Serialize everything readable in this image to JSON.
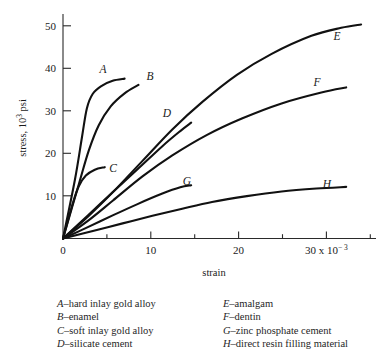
{
  "figure": {
    "background_color": "#ffffff",
    "line_color": "#111111",
    "axis_color": "#2a2a2a"
  },
  "axes": {
    "x_title": "strain",
    "y_title_main": "stress, 10",
    "y_title_exp": "3",
    "y_title_unit": " psi",
    "x_exponent_label": "30 x 10",
    "x_exponent_sup": "− 3",
    "x_ticks": [
      "0",
      "10",
      "20"
    ],
    "y_ticks": [
      "50",
      "40",
      "30",
      "20",
      "10",
      "0"
    ]
  },
  "curve_labels": {
    "A": "A",
    "B": "B",
    "C": "C",
    "D": "D",
    "E": "E",
    "F": "F",
    "G": "G",
    "H": "H"
  },
  "legend": {
    "left_column": [
      {
        "key": "A",
        "dash": "–",
        "text": "hard inlay gold alloy"
      },
      {
        "key": "B",
        "dash": "–",
        "text": "enamel"
      },
      {
        "key": "C",
        "dash": "–",
        "text": "soft inlay gold alloy"
      },
      {
        "key": "D",
        "dash": "–",
        "text": "silicate cement"
      }
    ],
    "right_column": [
      {
        "key": "E",
        "dash": "–",
        "text": "amalgam"
      },
      {
        "key": "F",
        "dash": "–",
        "text": "dentin"
      },
      {
        "key": "G",
        "dash": "–",
        "text": "zinc phosphate cement"
      },
      {
        "key": "H",
        "dash": "–",
        "text": "direct resin filling material"
      }
    ]
  },
  "chart_data": {
    "type": "line",
    "title": "",
    "xlabel": "strain",
    "ylabel": "stress, 10^3 psi",
    "xlim": [
      0,
      31.5
    ],
    "ylim": [
      0,
      53.5
    ],
    "x_tick_values": [
      0,
      10,
      20,
      30
    ],
    "x_minor_tick_values": [
      5,
      15,
      25
    ],
    "y_tick_values": [
      0,
      10,
      20,
      30,
      40,
      50
    ],
    "x_unit_multiplier": "10^-3",
    "grid": false,
    "legend_position": "below-axes",
    "series": [
      {
        "name": "A",
        "label": "hard inlay gold alloy",
        "points": [
          [
            0,
            0
          ],
          [
            1.2,
            14
          ],
          [
            1.9,
            24
          ],
          [
            2.4,
            31
          ],
          [
            3.0,
            34.5
          ],
          [
            3.9,
            36.4
          ],
          [
            5.0,
            37.6
          ],
          [
            6.2,
            38.1
          ]
        ]
      },
      {
        "name": "B",
        "label": "enamel",
        "points": [
          [
            0,
            0
          ],
          [
            1.6,
            13
          ],
          [
            2.6,
            21
          ],
          [
            3.6,
            27
          ],
          [
            4.8,
            31.5
          ],
          [
            6.2,
            34.6
          ],
          [
            7.6,
            36.6
          ]
        ]
      },
      {
        "name": "C",
        "label": "soft inlay gold alloy",
        "points": [
          [
            0,
            0
          ],
          [
            1.0,
            8.5
          ],
          [
            1.6,
            12.5
          ],
          [
            2.3,
            15.0
          ],
          [
            3.2,
            16.4
          ],
          [
            4.2,
            17.0
          ]
        ]
      },
      {
        "name": "D",
        "label": "silicate cement",
        "points": [
          [
            0,
            0
          ],
          [
            2.5,
            5.5
          ],
          [
            5.0,
            11.0
          ],
          [
            7.5,
            16.5
          ],
          [
            10.0,
            22.0
          ],
          [
            11.8,
            25.6
          ],
          [
            12.9,
            27.6
          ]
        ]
      },
      {
        "name": "E",
        "label": "amalgam",
        "points": [
          [
            0,
            0
          ],
          [
            2.5,
            5.2
          ],
          [
            5.0,
            11.0
          ],
          [
            8.0,
            18.5
          ],
          [
            11.0,
            26.0
          ],
          [
            14.0,
            32.5
          ],
          [
            17.5,
            39.0
          ],
          [
            21.0,
            44.0
          ],
          [
            25.0,
            48.3
          ],
          [
            28.0,
            50.2
          ],
          [
            30.0,
            51.0
          ]
        ]
      },
      {
        "name": "F",
        "label": "dentin",
        "points": [
          [
            0,
            0
          ],
          [
            2.5,
            4.2
          ],
          [
            5.0,
            9.0
          ],
          [
            8.0,
            14.8
          ],
          [
            11.0,
            19.8
          ],
          [
            14.5,
            24.7
          ],
          [
            18.0,
            28.6
          ],
          [
            22.0,
            32.2
          ],
          [
            26.0,
            34.8
          ],
          [
            28.5,
            36.0
          ]
        ]
      },
      {
        "name": "G",
        "label": "zinc phosphate cement",
        "points": [
          [
            0,
            0
          ],
          [
            2.5,
            2.7
          ],
          [
            5.0,
            5.5
          ],
          [
            7.5,
            8.2
          ],
          [
            10.0,
            10.7
          ],
          [
            11.8,
            12.2
          ],
          [
            12.9,
            12.7
          ]
        ]
      },
      {
        "name": "H",
        "label": "direct resin filling material",
        "points": [
          [
            0,
            0
          ],
          [
            3.0,
            1.8
          ],
          [
            6.0,
            3.6
          ],
          [
            9.0,
            5.4
          ],
          [
            12.0,
            7.1
          ],
          [
            15.0,
            8.7
          ],
          [
            18.5,
            10.1
          ],
          [
            22.0,
            11.2
          ],
          [
            25.5,
            11.9
          ],
          [
            28.5,
            12.3
          ]
        ]
      }
    ]
  }
}
